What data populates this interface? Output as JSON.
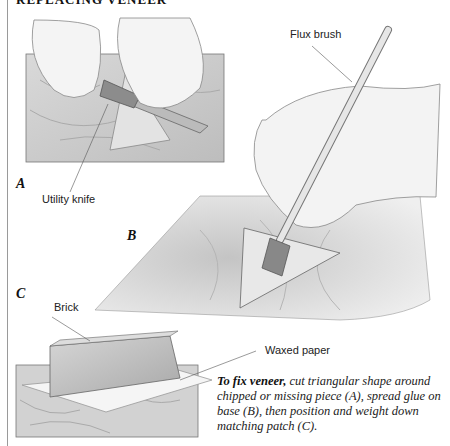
{
  "header": {
    "title": "REPLACING VENEER"
  },
  "panels": [
    {
      "id": "A",
      "letter": "A",
      "callouts": [
        "Utility knife"
      ]
    },
    {
      "id": "B",
      "letter": "B",
      "callouts": [
        "Flux brush"
      ]
    },
    {
      "id": "C",
      "letter": "C",
      "callouts": [
        "Brick",
        "Waxed paper"
      ]
    }
  ],
  "caption": {
    "lead": "To fix veneer,",
    "body": " cut triangular shape around chipped or missing piece (A), spread glue on base (B), then position and weight down matching patch (C)."
  },
  "colors": {
    "ink": "#222222",
    "wood": "#cfcfcf",
    "border": "#9a9a9a"
  }
}
